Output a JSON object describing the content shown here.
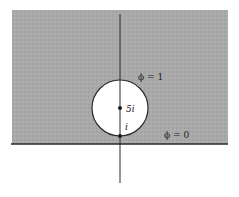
{
  "diagram": {
    "colors": {
      "background": "#ffffff",
      "shaded_region": "#a9a9a9",
      "line": "#2a2a2a",
      "circle_fill": "#ffffff"
    },
    "labels": {
      "phi_one": "ϕ = 1",
      "phi_zero": "ϕ = 0",
      "center_point": "5i",
      "tangent_point": "i"
    },
    "points": [
      {
        "name": "center",
        "label": "5i"
      },
      {
        "name": "tangent",
        "label": "i"
      }
    ]
  }
}
